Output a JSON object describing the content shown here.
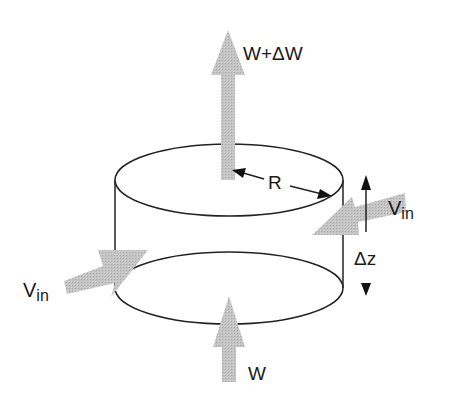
{
  "diagram": {
    "type": "control-volume cylinder",
    "labels": {
      "top_flow": "W+ΔW",
      "bottom_flow": "W",
      "radius": "R",
      "height": "Δz",
      "inflow_left_main": "V",
      "inflow_left_sub": "in",
      "inflow_right_main": "V",
      "inflow_right_sub": "in"
    },
    "colors": {
      "line": "#222222",
      "arrow_fill": "#bdbdbd",
      "background": "#ffffff"
    }
  }
}
